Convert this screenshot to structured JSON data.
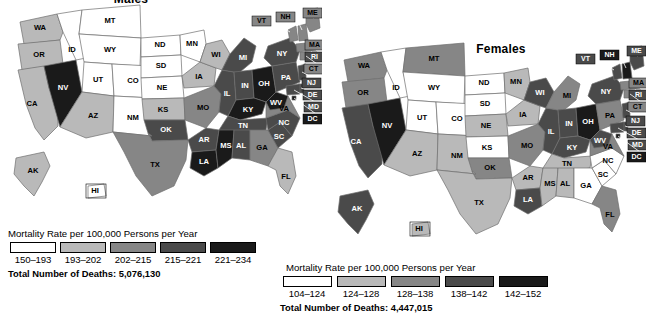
{
  "figure": {
    "kind": "choropleth-map-pair"
  },
  "palette": {
    "level1": "#ffffff",
    "level2": "#b9b9b9",
    "level3": "#868686",
    "level4": "#4a4a4a",
    "level5": "#1a1a1a",
    "border": "#6f6f6f"
  },
  "males": {
    "title": "Males",
    "legend": {
      "title": "Mortality Rate per 100,000 Persons per Year",
      "bins": [
        "150–193",
        "193–202",
        "202–215",
        "215–221",
        "221–234"
      ],
      "total_label": "Total Number of Deaths: 5,076,130"
    },
    "states": {
      "AK": 2,
      "AL": 4,
      "AR": 4,
      "AZ": 2,
      "CA": 2,
      "CO": 1,
      "CT": 3,
      "DC": 5,
      "DE": 4,
      "FL": 2,
      "GA": 3,
      "HI": 1,
      "IA": 2,
      "ID": 1,
      "IL": 4,
      "IN": 4,
      "KS": 2,
      "KY": 5,
      "LA": 5,
      "MA": 3,
      "MD": 4,
      "ME": 3,
      "MI": 4,
      "MN": 1,
      "MO": 3,
      "MS": 5,
      "MT": 1,
      "NC": 4,
      "ND": 1,
      "NE": 1,
      "NH": 3,
      "NJ": 4,
      "NM": 1,
      "NV": 5,
      "NY": 4,
      "OH": 5,
      "OK": 4,
      "OR": 2,
      "PA": 4,
      "RI": 4,
      "SC": 4,
      "SD": 1,
      "TN": 4,
      "TX": 3,
      "UT": 1,
      "VA": 3,
      "VT": 3,
      "WA": 2,
      "WI": 2,
      "WV": 5,
      "WY": 1
    }
  },
  "females": {
    "title": "Females",
    "legend": {
      "title": "Mortality Rate per 100,000  Persons per Year",
      "bins": [
        "104–124",
        "124–128",
        "128–138",
        "138–142",
        "142–152"
      ],
      "total_label": "Total Number of Deaths: 4,447,015"
    },
    "states": {
      "AK": 4,
      "AL": 2,
      "AR": 2,
      "AZ": 2,
      "CA": 4,
      "CO": 1,
      "CT": 3,
      "DC": 5,
      "DE": 4,
      "FL": 3,
      "GA": 1,
      "HI": 2,
      "IA": 2,
      "ID": 1,
      "IL": 4,
      "IN": 4,
      "KS": 1,
      "KY": 4,
      "LA": 4,
      "MA": 3,
      "MD": 4,
      "ME": 4,
      "MI": 3,
      "MN": 2,
      "MO": 3,
      "MS": 2,
      "MT": 3,
      "NC": 1,
      "ND": 1,
      "NE": 2,
      "NH": 5,
      "NJ": 4,
      "NM": 2,
      "NV": 5,
      "NY": 4,
      "OH": 5,
      "OK": 3,
      "OR": 3,
      "PA": 3,
      "RI": 4,
      "SC": 1,
      "SD": 1,
      "TN": 2,
      "TX": 2,
      "UT": 1,
      "VA": 3,
      "VT": 4,
      "WA": 3,
      "WI": 4,
      "WV": 4,
      "WY": 1
    }
  },
  "state_labels": [
    "WA",
    "OR",
    "CA",
    "NV",
    "ID",
    "MT",
    "WY",
    "UT",
    "CO",
    "AZ",
    "NM",
    "ND",
    "SD",
    "NE",
    "KS",
    "OK",
    "TX",
    "MN",
    "IA",
    "MO",
    "AR",
    "LA",
    "WI",
    "IL",
    "MI",
    "IN",
    "OH",
    "KY",
    "TN",
    "MS",
    "AL",
    "GA",
    "FL",
    "SC",
    "NC",
    "VA",
    "WV",
    "PA",
    "NY",
    "AK",
    "HI"
  ],
  "callout_labels": [
    "VT",
    "NH",
    "ME",
    "MA",
    "RI",
    "CT",
    "NJ",
    "DE",
    "MD",
    "DC"
  ],
  "chart_data": {
    "type": "heatmap",
    "title": "Mortality Rate per 100,000 Persons per Year",
    "panels": [
      {
        "name": "Males",
        "bins": [
          "150–193",
          "193–202",
          "202–215",
          "215–221",
          "221–234"
        ],
        "total_deaths": "5,076,130",
        "range": [
          150,
          234
        ]
      },
      {
        "name": "Females",
        "bins": [
          "104–124",
          "124–128",
          "128–138",
          "138–142",
          "142–152"
        ],
        "total_deaths": "4,447,015",
        "range": [
          104,
          152
        ]
      }
    ],
    "legend_position": "below-each-map",
    "grid": false
  }
}
